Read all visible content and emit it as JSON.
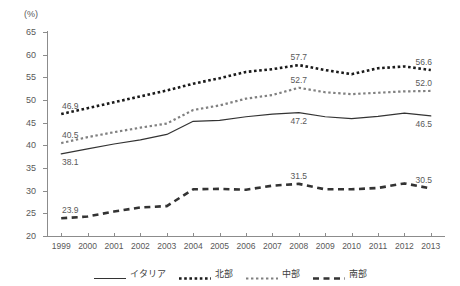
{
  "axis": {
    "unit_label": "(%)",
    "y_ticks": [
      20,
      25,
      30,
      35,
      40,
      45,
      50,
      55,
      60,
      65
    ],
    "x_ticks": [
      "1999",
      "2000",
      "2001",
      "2002",
      "2003",
      "2004",
      "2005",
      "2006",
      "2007",
      "2008",
      "2009",
      "2010",
      "2011",
      "2012",
      "2013"
    ]
  },
  "legend": {
    "items": [
      {
        "label": "イタリア",
        "key": "solid-line-key",
        "color": "#333333"
      },
      {
        "label": "北部",
        "key": "dotted-thick-key",
        "color": "#1a1a1a"
      },
      {
        "label": "中部",
        "key": "dotted-gray-key",
        "color": "#808080"
      },
      {
        "label": "南部",
        "key": "dashed-key",
        "color": "#333333"
      }
    ]
  },
  "chart_data": {
    "type": "line",
    "title": "",
    "xlabel": "",
    "ylabel": "(%)",
    "ylim": [
      20,
      65
    ],
    "grid": false,
    "legend_position": "bottom",
    "x": [
      "1999",
      "2000",
      "2001",
      "2002",
      "2003",
      "2004",
      "2005",
      "2006",
      "2007",
      "2008",
      "2009",
      "2010",
      "2011",
      "2012",
      "2013"
    ],
    "series": [
      {
        "name": "イタリア",
        "style": "solid",
        "color": "#333333",
        "values": [
          38.1,
          39.2,
          40.3,
          41.2,
          42.4,
          45.3,
          45.5,
          46.3,
          46.9,
          47.2,
          46.3,
          45.9,
          46.4,
          47.1,
          46.5
        ],
        "point_labels": [
          {
            "x": "1999",
            "value": 38.1,
            "text": "38.1",
            "position": "below"
          },
          {
            "x": "2008",
            "value": 47.2,
            "text": "47.2",
            "position": "below"
          },
          {
            "x": "2013",
            "value": 46.5,
            "text": "46.5",
            "position": "below"
          }
        ]
      },
      {
        "name": "北部",
        "style": "dotted",
        "color": "#1a1a1a",
        "values": [
          46.9,
          48.2,
          49.5,
          50.8,
          52.1,
          53.6,
          54.8,
          56.2,
          56.8,
          57.7,
          56.6,
          55.7,
          57.0,
          57.4,
          56.6
        ],
        "point_labels": [
          {
            "x": "1999",
            "value": 46.9,
            "text": "46.9",
            "position": "above"
          },
          {
            "x": "2008",
            "value": 57.7,
            "text": "57.7",
            "position": "above"
          },
          {
            "x": "2013",
            "value": 56.6,
            "text": "56.6",
            "position": "above"
          }
        ]
      },
      {
        "name": "中部",
        "style": "dotted",
        "color": "#808080",
        "values": [
          40.5,
          41.8,
          42.9,
          43.9,
          44.8,
          47.8,
          48.8,
          50.3,
          51.1,
          52.7,
          51.7,
          51.3,
          51.6,
          51.9,
          52.0
        ],
        "point_labels": [
          {
            "x": "1999",
            "value": 40.5,
            "text": "40.5",
            "position": "above"
          },
          {
            "x": "2008",
            "value": 52.7,
            "text": "52.7",
            "position": "above"
          },
          {
            "x": "2013",
            "value": 52.0,
            "text": "52.0",
            "position": "above"
          }
        ]
      },
      {
        "name": "南部",
        "style": "dashed",
        "color": "#333333",
        "values": [
          23.9,
          24.3,
          25.4,
          26.3,
          26.6,
          30.3,
          30.4,
          30.2,
          31.1,
          31.5,
          30.3,
          30.3,
          30.6,
          31.6,
          30.5
        ],
        "point_labels": [
          {
            "x": "1999",
            "value": 23.9,
            "text": "23.9",
            "position": "above"
          },
          {
            "x": "2008",
            "value": 31.5,
            "text": "31.5",
            "position": "above"
          },
          {
            "x": "2013",
            "value": 30.5,
            "text": "30.5",
            "position": "above"
          }
        ]
      }
    ]
  }
}
